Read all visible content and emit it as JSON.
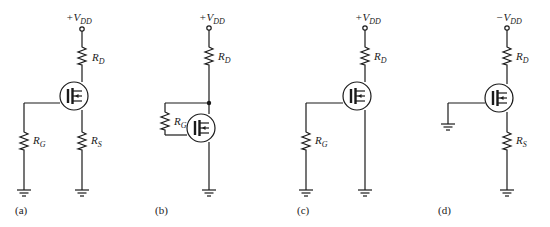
{
  "figure": {
    "circuits": [
      {
        "id": "a",
        "caption": "(a)",
        "supply": {
          "sign": "+",
          "symbol": "V",
          "subscript": "DD"
        },
        "drain_resistor": {
          "symbol": "R",
          "subscript": "D"
        },
        "gate_resistor": {
          "symbol": "R",
          "subscript": "G"
        },
        "source_resistor": {
          "symbol": "R",
          "subscript": "S"
        }
      },
      {
        "id": "b",
        "caption": "(b)",
        "supply": {
          "sign": "+",
          "symbol": "V",
          "subscript": "DD"
        },
        "drain_resistor": {
          "symbol": "R",
          "subscript": "D"
        },
        "gate_resistor": {
          "symbol": "R",
          "subscript": "G"
        }
      },
      {
        "id": "c",
        "caption": "(c)",
        "supply": {
          "sign": "+",
          "symbol": "V",
          "subscript": "DD"
        },
        "drain_resistor": {
          "symbol": "R",
          "subscript": "D"
        },
        "gate_resistor": {
          "symbol": "R",
          "subscript": "G"
        }
      },
      {
        "id": "d",
        "caption": "(d)",
        "supply": {
          "sign": "−",
          "symbol": "V",
          "subscript": "DD"
        },
        "drain_resistor": {
          "symbol": "R",
          "subscript": "D"
        },
        "source_resistor": {
          "symbol": "R",
          "subscript": "S"
        }
      }
    ]
  }
}
